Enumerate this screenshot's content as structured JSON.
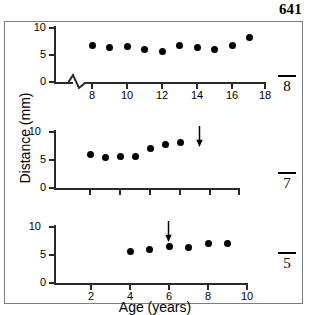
{
  "page_number": "641",
  "axis_titles": {
    "y": "Distance (mm)",
    "x": "Age (years)"
  },
  "panels": [
    {
      "id": "panel-tooth-8",
      "tooth_label": "8",
      "tooth_label_overbar": true,
      "y_ticks": [
        "0",
        "5",
        "10"
      ],
      "x_ticks": [
        "8",
        "10",
        "12",
        "14",
        "16",
        "18"
      ],
      "has_axis_break": true,
      "arrow": null
    },
    {
      "id": "panel-tooth-7",
      "tooth_label": "7",
      "tooth_label_overbar": true,
      "y_ticks": [
        "0",
        "5",
        "10"
      ],
      "x_ticks": [
        "",
        "",
        "",
        "",
        "",
        ""
      ],
      "has_axis_break": false,
      "arrow": {
        "label": "eruption-arrow"
      }
    },
    {
      "id": "panel-tooth-5",
      "tooth_label": "5",
      "tooth_label_overbar": true,
      "y_ticks": [
        "0",
        "5",
        "10"
      ],
      "x_ticks": [
        "2",
        "4",
        "6",
        "8",
        "10"
      ],
      "has_axis_break": false,
      "arrow": {
        "label": "eruption-arrow"
      }
    }
  ],
  "chart_data": [
    {
      "type": "scatter",
      "title": "8",
      "xlabel": "Age (years)",
      "ylabel": "Distance (mm)",
      "xlim": [
        7,
        19
      ],
      "ylim": [
        0,
        11
      ],
      "xticks": [
        8,
        10,
        12,
        14,
        16,
        18
      ],
      "yticks": [
        0,
        5,
        10
      ],
      "grid": false,
      "axis_break_x": true,
      "legend": "none",
      "x": [
        8,
        9,
        10,
        11,
        12,
        13,
        14,
        15,
        16,
        17
      ],
      "y": [
        6.8,
        6.3,
        6.5,
        6.1,
        5.7,
        6.7,
        6.3,
        6.1,
        6.7,
        8.3
      ]
    },
    {
      "type": "scatter",
      "title": "7",
      "xlabel": "Age (years)",
      "ylabel": "Distance (mm)",
      "xlim": [
        2,
        14
      ],
      "ylim": [
        0,
        11
      ],
      "xticks": [
        4,
        6,
        8,
        10,
        12
      ],
      "yticks": [
        0,
        5,
        10
      ],
      "grid": false,
      "axis_break_x": false,
      "legend": "none",
      "annotations": [
        {
          "type": "arrow",
          "x": 7,
          "direction": "down"
        }
      ],
      "x": [
        4,
        5,
        6,
        7,
        8,
        9,
        10
      ],
      "y": [
        5.9,
        5.5,
        5.7,
        5.7,
        7.0,
        7.8,
        8.2
      ]
    },
    {
      "type": "scatter",
      "title": "5",
      "xlabel": "Age (years)",
      "ylabel": "Distance (mm)",
      "xlim": [
        0,
        11
      ],
      "ylim": [
        0,
        11
      ],
      "xticks": [
        2,
        4,
        6,
        8,
        10
      ],
      "yticks": [
        0,
        5,
        10
      ],
      "grid": false,
      "axis_break_x": false,
      "legend": "none",
      "annotations": [
        {
          "type": "arrow",
          "x": 6,
          "direction": "down"
        }
      ],
      "x": [
        4,
        5,
        6,
        7,
        8,
        9
      ],
      "y": [
        5.6,
        5.9,
        6.6,
        6.4,
        7.1,
        7.1
      ]
    }
  ]
}
